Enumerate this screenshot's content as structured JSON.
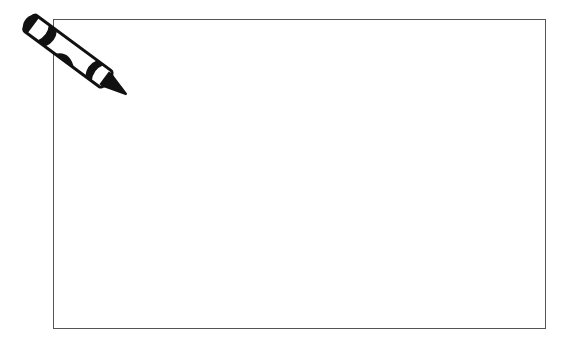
{
  "canvas": {
    "background_color": "#ffffff",
    "frame_border_color": "#555555"
  },
  "icons": {
    "crayon": "crayon-icon"
  }
}
